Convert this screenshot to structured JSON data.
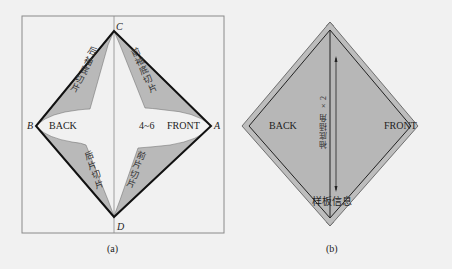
{
  "figure_a": {
    "caption": "(a)",
    "points": {
      "A": "A",
      "B": "B",
      "C": "C",
      "D": "D"
    },
    "labels": {
      "back": "BACK",
      "front": "FRONT",
      "range": "4~6"
    },
    "pieces": {
      "upper_left": "后袖底切片",
      "upper_right": "前袖底切片",
      "lower_left": "后片切片",
      "lower_right": "前片切片"
    }
  },
  "figure_b": {
    "caption": "(b)",
    "labels": {
      "back": "BACK",
      "front": "FRONT",
      "grain": "袖底插角 ×2",
      "info": "样板信息"
    }
  },
  "colors": {
    "background": "#f1f1f1",
    "piece_fill": "#b9b9b9",
    "outline": "#111111",
    "frame": "#8a8a8a"
  }
}
